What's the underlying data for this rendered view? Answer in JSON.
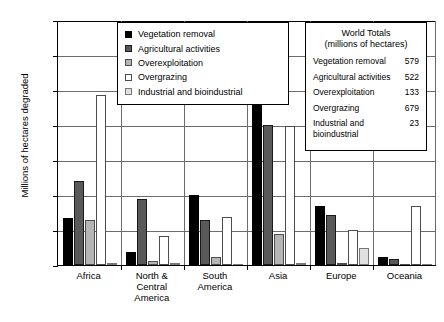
{
  "chart_data": {
    "type": "bar",
    "title": "",
    "xlabel": "",
    "ylabel": "Millions of hectares degraded",
    "ylim": [
      0,
      350
    ],
    "yticks": [
      0,
      50,
      100,
      150,
      200,
      250,
      300,
      350
    ],
    "grid": true,
    "legend_position": "inside upper-center",
    "categories": [
      "Africa",
      "North & Central America",
      "South America",
      "Asia",
      "Europe",
      "Oceania"
    ],
    "series": [
      {
        "name": "Vegetation removal",
        "color": "#000000",
        "values": [
          67,
          19,
          100,
          300,
          84,
          12
        ]
      },
      {
        "name": "Agricultural activities",
        "color": "#595959",
        "values": [
          120,
          94,
          64,
          200,
          72,
          8
        ]
      },
      {
        "name": "Overexploitation",
        "color": "#b5b5b5",
        "values": [
          65,
          6,
          12,
          44,
          1,
          0
        ]
      },
      {
        "name": "Overgrazing",
        "color": "#ffffff",
        "values": [
          243,
          41,
          68,
          198,
          50,
          84
        ]
      },
      {
        "name": "Industrial and bioindustrial",
        "color": "#e0e0e0",
        "values": [
          1,
          2,
          0,
          1,
          25,
          0
        ]
      }
    ]
  },
  "legend": {
    "items": [
      {
        "label": "Vegetation removal"
      },
      {
        "label": "Agricultural activities"
      },
      {
        "label": "Overexploitation"
      },
      {
        "label": "Overgrazing"
      },
      {
        "label": "Industrial and bioindustrial"
      }
    ]
  },
  "totals_box": {
    "title_line1": "World Totals",
    "title_line2": "(millions of hectares)",
    "rows": [
      {
        "name": "Vegetation removal",
        "value": "579"
      },
      {
        "name": "Agricultural activities",
        "value": "522"
      },
      {
        "name": "Overexploitation",
        "value": "133"
      },
      {
        "name": "Overgrazing",
        "value": "679"
      },
      {
        "name": "Industrial and\nbioindustrial",
        "value": "23"
      }
    ]
  }
}
